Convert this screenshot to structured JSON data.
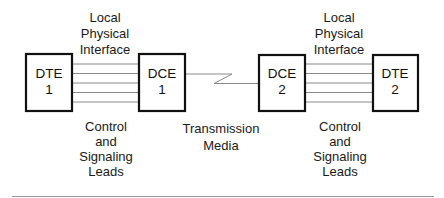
{
  "diagram": {
    "nodes": [
      {
        "id": "dte1",
        "line1": "DTE",
        "line2": "1"
      },
      {
        "id": "dce1",
        "line1": "DCE",
        "line2": "1"
      },
      {
        "id": "dce2",
        "line1": "DCE",
        "line2": "2"
      },
      {
        "id": "dte2",
        "line1": "DTE",
        "line2": "2"
      }
    ],
    "labels": {
      "interface_left": [
        "Local",
        "Physical",
        "Interface"
      ],
      "interface_right": [
        "Local",
        "Physical",
        "Interface"
      ],
      "leads_left": [
        "Control",
        "and",
        "Signaling",
        "Leads"
      ],
      "leads_right": [
        "Control",
        "and",
        "Signaling",
        "Leads"
      ],
      "media": [
        "Transmission",
        "Media"
      ]
    },
    "edges": [
      {
        "from": "dte1",
        "to": "dce1",
        "type": "local-physical-interface",
        "lines": 5
      },
      {
        "from": "dce1",
        "to": "dce2",
        "type": "transmission-media"
      },
      {
        "from": "dce2",
        "to": "dte2",
        "type": "local-physical-interface",
        "lines": 5
      }
    ],
    "colors": {
      "box_stroke": "#111111",
      "lead_lines": "#8a8a8a",
      "rule": "#9a9a9a"
    }
  }
}
